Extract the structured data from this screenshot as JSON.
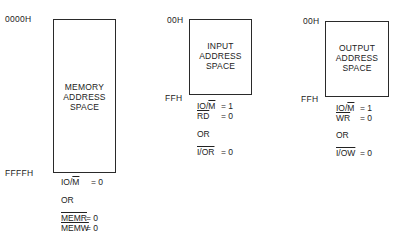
{
  "memory": {
    "start_address": "0000H",
    "end_address": "FFFFH",
    "title_lines": [
      "MEMORY",
      "ADDRESS",
      "SPACE"
    ],
    "conditions": {
      "io_m": {
        "signal": "IO/",
        "bar_part": "M",
        "value": "= 0"
      },
      "or": "OR",
      "memr": {
        "signal": "MEMR",
        "value": "= 0"
      },
      "memw": {
        "signal": "MEMW",
        "value": "= 0"
      }
    }
  },
  "input": {
    "start_address": "00H",
    "end_address": "FFH",
    "title_lines": [
      "INPUT",
      "ADDRESS",
      "SPACE"
    ],
    "conditions": {
      "io_m": {
        "signal": "IO/",
        "bar_part": "M",
        "value": "= 1"
      },
      "rd": {
        "signal": "RD",
        "value": "= 0"
      },
      "or": "OR",
      "ior": {
        "signal": "I/OR",
        "value": "= 0"
      }
    }
  },
  "output": {
    "start_address": "00H",
    "end_address": "FFH",
    "title_lines": [
      "OUTPUT",
      "ADDRESS",
      "SPACE"
    ],
    "conditions": {
      "io_m": {
        "signal": "IO/",
        "bar_part": "M",
        "value": "= 1"
      },
      "wr": {
        "signal": "WR",
        "value": "= 0"
      },
      "or": "OR",
      "iow": {
        "signal": "I/OW",
        "value": "= 0"
      }
    }
  }
}
